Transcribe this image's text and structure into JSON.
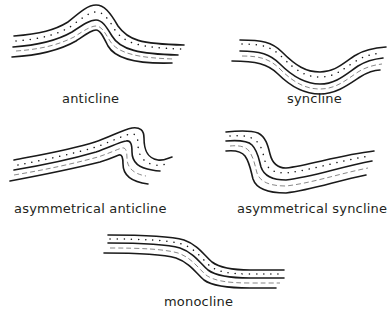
{
  "diagram": {
    "folds": [
      {
        "id": "anticline",
        "label": "anticline"
      },
      {
        "id": "syncline",
        "label": "syncline"
      },
      {
        "id": "asymmetrical-anticline",
        "label": "asymmetrical anticline"
      },
      {
        "id": "asymmetrical-syncline",
        "label": "asymmetrical syncline"
      },
      {
        "id": "monocline",
        "label": "monocline"
      }
    ],
    "legend_patterns": {
      "upper_layer": "dotted (sandstone)",
      "lower_layer": "dashed (shale)"
    },
    "colors": {
      "line": "#1a1a1a",
      "text": "#231f20",
      "background": "#ffffff"
    }
  }
}
